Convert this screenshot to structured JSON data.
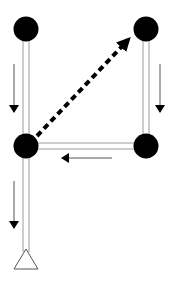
{
  "diagram": {
    "type": "flow-network",
    "background": "#ffffff",
    "colors": {
      "node": "#000000",
      "rail": "#9a9a9a",
      "arrow": "#000000",
      "dashed_arrow": "#000000",
      "terminal_outline": "#555555"
    },
    "nodes": [
      {
        "id": "top-left",
        "x": 26,
        "y": 29,
        "r": 12
      },
      {
        "id": "top-right",
        "x": 146,
        "y": 29,
        "r": 12
      },
      {
        "id": "middle-left",
        "x": 26,
        "y": 146,
        "r": 12
      },
      {
        "id": "middle-right",
        "x": 146,
        "y": 146,
        "r": 12
      }
    ],
    "edges": [
      {
        "id": "left-upper-rail",
        "from": "top-left",
        "to": "middle-left",
        "style": "double-line"
      },
      {
        "id": "right-rail",
        "from": "top-right",
        "to": "middle-right",
        "style": "double-line"
      },
      {
        "id": "horizontal-rail",
        "from": "middle-right",
        "to": "middle-left",
        "style": "double-line"
      },
      {
        "id": "left-lower-rail",
        "from": "middle-left",
        "to": "terminal",
        "style": "double-line"
      },
      {
        "id": "dashed-link",
        "from": "middle-left",
        "to": "top-right",
        "style": "dashed-arrow"
      }
    ],
    "flow_arrows": [
      {
        "id": "flow-left-upper",
        "direction": "down",
        "x1": 14,
        "y1": 64,
        "x2": 14,
        "y2": 112
      },
      {
        "id": "flow-right",
        "direction": "down",
        "x1": 160,
        "y1": 64,
        "x2": 160,
        "y2": 112
      },
      {
        "id": "flow-horizontal",
        "direction": "left",
        "x1": 112,
        "y1": 158,
        "x2": 62,
        "y2": 158
      },
      {
        "id": "flow-left-lower",
        "direction": "down",
        "x1": 14,
        "y1": 181,
        "x2": 14,
        "y2": 228
      }
    ],
    "terminal": {
      "id": "terminal",
      "shape": "triangle",
      "apex_x": 26,
      "apex_y": 250,
      "base_y": 269,
      "half_width": 12
    }
  }
}
